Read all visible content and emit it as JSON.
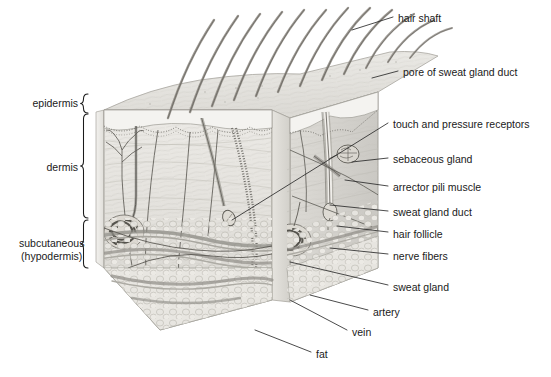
{
  "figure": {
    "style": "grayscale pencil anatomical illustration",
    "colors": {
      "ink": "#1a1a1a",
      "leader_line": "#2b2b2b",
      "background": "#ffffff",
      "tissue_light": "#eceae7",
      "tissue_mid": "#dcdad6",
      "tissue_dark": "#c2c0bb",
      "vessel": "#8d8b86",
      "hair": "#9a968f"
    }
  },
  "layer_labels": [
    {
      "id": "epidermis",
      "text": "epidermis",
      "x": 38,
      "y": 97,
      "bracket": {
        "x": 88,
        "top": 94,
        "bottom": 113
      }
    },
    {
      "id": "dermis",
      "text": "dermis",
      "x": 51,
      "y": 161,
      "bracket": {
        "x": 88,
        "top": 114,
        "bottom": 218
      }
    },
    {
      "id": "subcutaneous",
      "text": "subcutaneous\n(hypodermis)",
      "x": 19,
      "y": 237,
      "bracket": {
        "x": 88,
        "top": 220,
        "bottom": 268
      }
    }
  ],
  "callouts": [
    {
      "id": "hair-shaft",
      "text": "hair shaft",
      "x": 398,
      "y": 12,
      "leader": [
        [
          393,
          17
        ],
        [
          352,
          30
        ]
      ]
    },
    {
      "id": "pore-of-sweat-gland-duct",
      "text": "pore of sweat gland duct",
      "x": 403,
      "y": 66,
      "leader": [
        [
          398,
          71
        ],
        [
          372,
          78
        ]
      ]
    },
    {
      "id": "touch-and-pressure-receptors",
      "text": "touch and pressure receptors",
      "x": 393,
      "y": 118,
      "leader": [
        [
          388,
          123
        ],
        [
          232,
          220
        ]
      ]
    },
    {
      "id": "sebaceous-gland",
      "text": "sebaceous gland",
      "x": 393,
      "y": 153,
      "leader": [
        [
          388,
          158
        ],
        [
          352,
          162
        ]
      ]
    },
    {
      "id": "arrector-pili-muscle",
      "text": "arrector pili muscle",
      "x": 393,
      "y": 181,
      "leader": [
        [
          388,
          186
        ],
        [
          345,
          180
        ]
      ]
    },
    {
      "id": "sweat-gland-duct",
      "text": "sweat gland duct",
      "x": 393,
      "y": 206,
      "leader": [
        [
          388,
          211
        ],
        [
          330,
          205
        ]
      ]
    },
    {
      "id": "hair-follicle",
      "text": "hair follicle",
      "x": 393,
      "y": 228,
      "leader": [
        [
          388,
          232
        ],
        [
          337,
          226
        ]
      ]
    },
    {
      "id": "nerve-fibers",
      "text": "nerve fibers",
      "x": 393,
      "y": 250,
      "leader": [
        [
          388,
          254
        ],
        [
          330,
          248
        ]
      ]
    },
    {
      "id": "sweat-gland",
      "text": "sweat gland",
      "x": 393,
      "y": 281,
      "leader": [
        [
          388,
          285
        ],
        [
          290,
          262
        ]
      ]
    },
    {
      "id": "artery",
      "text": "artery",
      "x": 373,
      "y": 306,
      "leader": [
        [
          368,
          310
        ],
        [
          310,
          295
        ]
      ]
    },
    {
      "id": "vein",
      "text": "vein",
      "x": 352,
      "y": 326,
      "leader": [
        [
          347,
          330
        ],
        [
          290,
          300
        ]
      ]
    },
    {
      "id": "fat",
      "text": "fat",
      "x": 316,
      "y": 348,
      "leader": [
        [
          311,
          352
        ],
        [
          255,
          330
        ]
      ]
    }
  ]
}
